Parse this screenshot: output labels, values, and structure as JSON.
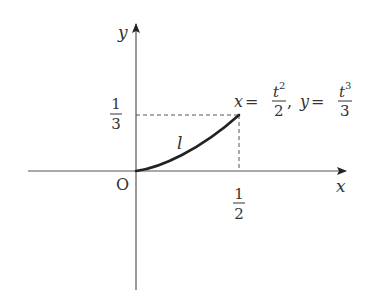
{
  "diagram": {
    "type": "parametric-curve-plot",
    "axes": {
      "x_label": "x",
      "y_label": "y",
      "origin_label": "O"
    },
    "ticks": {
      "x_tick": {
        "numerator": "1",
        "denominator": "2"
      },
      "y_tick": {
        "numerator": "1",
        "denominator": "3"
      }
    },
    "curve": {
      "label": "l",
      "equation": {
        "x_var": "x",
        "x_eq": "=",
        "x_num_base": "t",
        "x_num_exp": "2",
        "x_den": "2",
        "separator": ",",
        "y_var": "y",
        "y_eq": "=",
        "y_num_base": "t",
        "y_num_exp": "3",
        "y_den": "3"
      },
      "start_point": [
        0,
        0
      ],
      "end_point": [
        0.5,
        0.3333
      ]
    },
    "colors": {
      "axis": "#555555",
      "curve": "#222222",
      "dashed": "#555555",
      "text": "#333333"
    }
  }
}
